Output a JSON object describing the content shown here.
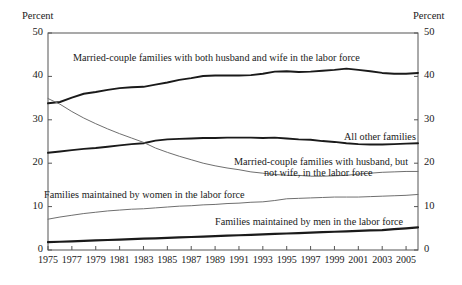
{
  "chart_data": {
    "type": "line",
    "title": "",
    "xlabel": "",
    "ylabel": "Percent",
    "ylabel_right": "Percent",
    "ylim": [
      0,
      50
    ],
    "xlim": [
      1975,
      2006
    ],
    "grid": false,
    "legend_position": "inline-annotations",
    "y_ticks": [
      "50",
      "40",
      "30",
      "20",
      "10",
      "0"
    ],
    "y_tick_values": [
      50,
      40,
      30,
      20,
      10,
      0
    ],
    "x_ticks": [
      "1975",
      "1977",
      "1979",
      "1981",
      "1983",
      "1985",
      "1987",
      "1989",
      "1991",
      "1993",
      "1995",
      "1997",
      "1999",
      "2001",
      "2003",
      "2005"
    ],
    "x_tick_values": [
      1975,
      1977,
      1979,
      1981,
      1983,
      1985,
      1987,
      1989,
      1991,
      1993,
      1995,
      1997,
      1999,
      2001,
      2003,
      2005
    ],
    "x": [
      1975,
      1976,
      1977,
      1978,
      1979,
      1980,
      1981,
      1982,
      1983,
      1984,
      1985,
      1986,
      1987,
      1988,
      1989,
      1990,
      1991,
      1992,
      1993,
      1994,
      1995,
      1996,
      1997,
      1998,
      1999,
      2000,
      2001,
      2002,
      2003,
      2004,
      2005,
      2006
    ],
    "series": [
      {
        "name": "Married-couple families with both husband and wife in the labor force",
        "color": "#1a1a1a",
        "width": 1.9,
        "values": [
          33.8,
          34.1,
          35.1,
          36.0,
          36.4,
          36.9,
          37.3,
          37.5,
          37.6,
          38.1,
          38.6,
          39.2,
          39.6,
          40.1,
          40.2,
          40.2,
          40.2,
          40.3,
          40.6,
          41.1,
          41.2,
          41.0,
          41.1,
          41.3,
          41.5,
          41.8,
          41.5,
          41.2,
          40.8,
          40.6,
          40.6,
          40.8
        ]
      },
      {
        "name": "All other families",
        "color": "#1a1a1a",
        "width": 1.9,
        "values": [
          22.4,
          22.7,
          23.0,
          23.3,
          23.5,
          23.8,
          24.1,
          24.4,
          24.6,
          25.2,
          25.5,
          25.6,
          25.7,
          25.8,
          25.8,
          25.9,
          25.9,
          25.9,
          25.8,
          25.9,
          25.7,
          25.5,
          25.4,
          25.1,
          24.9,
          24.6,
          24.4,
          24.3,
          24.3,
          24.4,
          24.5,
          24.6
        ]
      },
      {
        "name": "Married-couple families with husband, but not wife, in the labor force",
        "color": "#6f6f6f",
        "width": 1.0,
        "values": [
          34.9,
          33.6,
          31.9,
          30.4,
          29.1,
          27.9,
          26.8,
          25.8,
          24.8,
          23.5,
          22.5,
          21.6,
          20.8,
          20.0,
          19.4,
          18.9,
          18.5,
          18.0,
          17.7,
          17.4,
          17.2,
          17.2,
          17.0,
          17.0,
          17.1,
          17.2,
          17.5,
          17.7,
          17.9,
          18.0,
          18.1,
          18.1
        ]
      },
      {
        "name": "Families maintained by women in the labor force",
        "color": "#6f6f6f",
        "width": 1.0,
        "values": [
          7.1,
          7.6,
          8.0,
          8.4,
          8.7,
          9.0,
          9.2,
          9.4,
          9.5,
          9.7,
          9.9,
          10.1,
          10.2,
          10.4,
          10.5,
          10.7,
          10.8,
          11.0,
          11.1,
          11.4,
          11.8,
          11.9,
          12.0,
          12.1,
          12.2,
          12.2,
          12.2,
          12.3,
          12.4,
          12.5,
          12.6,
          12.8
        ]
      },
      {
        "name": "Families maintained by men in the labor force",
        "color": "#1a1a1a",
        "width": 2.2,
        "values": [
          1.8,
          1.9,
          2.0,
          2.1,
          2.2,
          2.3,
          2.4,
          2.5,
          2.6,
          2.7,
          2.8,
          2.9,
          3.0,
          3.1,
          3.2,
          3.3,
          3.4,
          3.5,
          3.6,
          3.7,
          3.8,
          3.9,
          4.0,
          4.1,
          4.2,
          4.3,
          4.4,
          4.5,
          4.6,
          4.8,
          5.0,
          5.2
        ]
      }
    ],
    "annotations": [
      {
        "id": "annot-both-spouses",
        "text": "Married-couple families with both husband and wife in the labor force",
        "x": 73,
        "y": 52
      },
      {
        "id": "annot-all-other",
        "text": "All other families",
        "x": 344,
        "y": 131
      },
      {
        "id": "annot-husband-only-line1",
        "text": "Married-couple families with husband, but",
        "x": 234,
        "y": 156
      },
      {
        "id": "annot-husband-only-line2",
        "text": "not wife, in the labor force",
        "x": 264,
        "y": 167
      },
      {
        "id": "annot-women",
        "text": "Families maintained by women in the labor force",
        "x": 44,
        "y": 189
      },
      {
        "id": "annot-men",
        "text": "Families maintained by men in the labor force",
        "x": 215,
        "y": 216
      }
    ]
  }
}
